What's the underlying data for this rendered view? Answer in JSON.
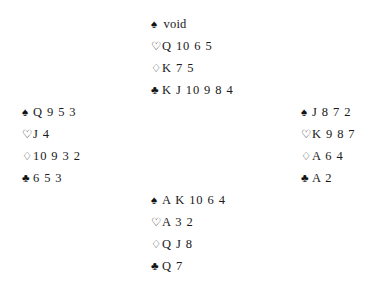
{
  "diagram": {
    "type": "bridge-deal-diagram",
    "background_color": "#ffffff",
    "text_color": "#1a1a1a"
  },
  "suits": {
    "spades": {
      "name": "spade-suit-symbol",
      "glyph": "♠",
      "style": "filled"
    },
    "hearts": {
      "name": "heart-suit-symbol",
      "glyph": "♡",
      "style": "hollow"
    },
    "diamonds": {
      "name": "diamond-suit-symbol",
      "glyph": "♢",
      "style": "hollow"
    },
    "clubs": {
      "name": "club-suit-symbol",
      "glyph": "♣",
      "style": "filled"
    }
  },
  "hands": {
    "north": {
      "position": "North",
      "spades": "void",
      "hearts": "Q 10 6 5",
      "diamonds": "K 7 5",
      "clubs": "K J 10 9 8 4"
    },
    "west": {
      "position": "West",
      "spades": "Q 9 5 3",
      "hearts": "J 4",
      "diamonds": "10 9 3 2",
      "clubs": "6 5 3"
    },
    "east": {
      "position": "East",
      "spades": "J 8 7 2",
      "hearts": "K 9 8 7",
      "diamonds": "A 6 4",
      "clubs": "A 2"
    },
    "south": {
      "position": "South",
      "spades": "A K 10 6 4",
      "hearts": "A 3 2",
      "diamonds": "Q J 8",
      "clubs": "Q 7"
    }
  }
}
